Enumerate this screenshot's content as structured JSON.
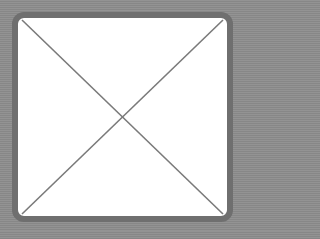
{
  "placeholder": {
    "type": "empty-image-placeholder",
    "colors": {
      "background": "#8c8c8c",
      "border": "#6f6f6f",
      "fill": "#ffffff",
      "cross": "#7a7a7a"
    }
  }
}
